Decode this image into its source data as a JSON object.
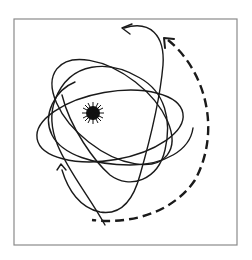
{
  "diagram": {
    "subject": "atom model with electron orbits",
    "frame": {
      "x": 14,
      "y": 19,
      "width": 223,
      "height": 226,
      "stroke": "#8a8a8a"
    },
    "nucleus": {
      "cx": 93,
      "cy": 113,
      "r": 9,
      "color": "#111111"
    },
    "orbits": [
      {
        "id": "orbit-1",
        "description": "ellipse tilted, upper-left to lower-right"
      },
      {
        "id": "orbit-2",
        "description": "wide horizontal ellipse"
      },
      {
        "id": "orbit-3",
        "description": "open orbit ending with arrow at top"
      },
      {
        "id": "orbit-4",
        "description": "open orbit ending with arrow at lower-left"
      }
    ],
    "motion_arrow": {
      "style": "dashed",
      "direction": "counter-clockwise arc on right side",
      "color": "#1a1a1a"
    },
    "line_color": "#1a1a1a",
    "background": "#ffffff"
  }
}
